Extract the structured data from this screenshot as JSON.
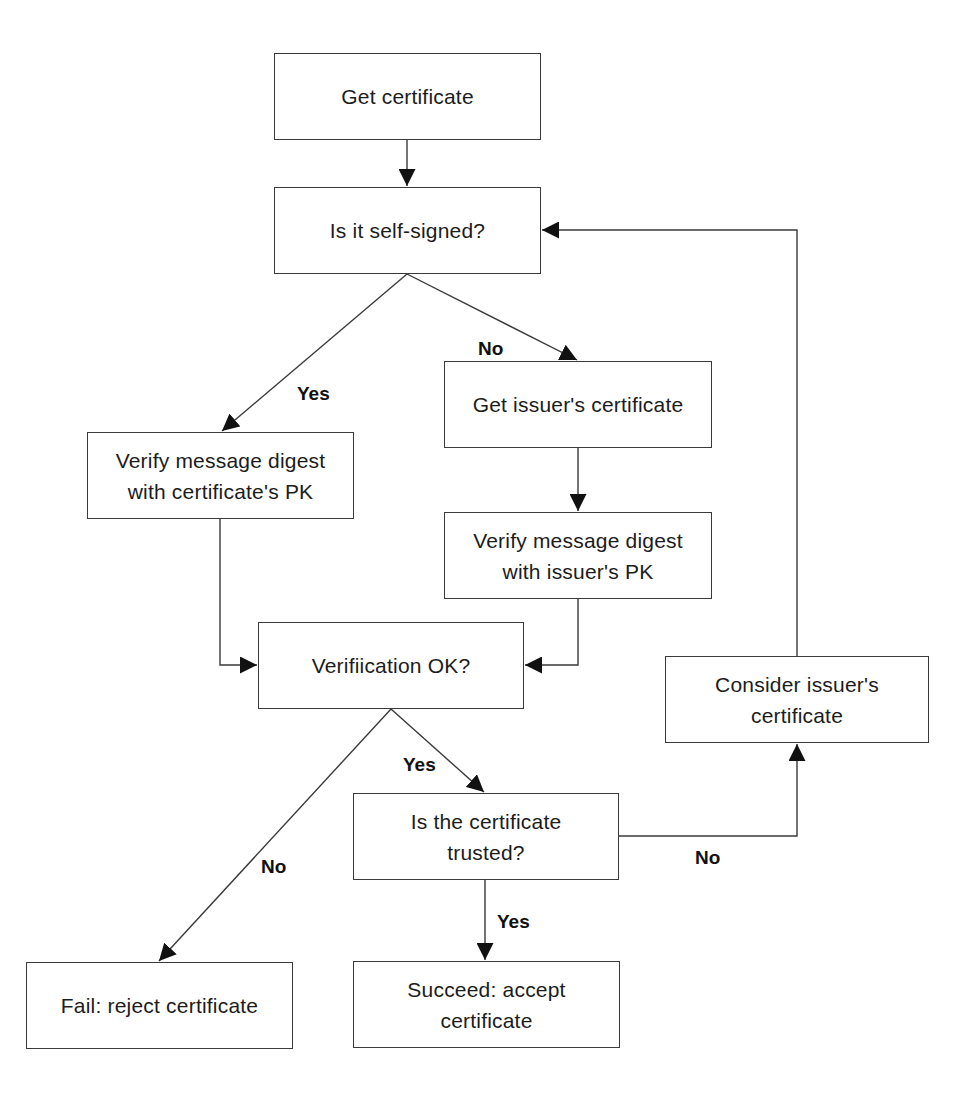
{
  "diagram": {
    "type": "flowchart",
    "nodes": [
      {
        "id": "get-cert",
        "text": "Get certificate",
        "x": 274,
        "y": 53,
        "w": 267,
        "h": 87
      },
      {
        "id": "self-signed",
        "text": "Is it self-signed?",
        "x": 274,
        "y": 187,
        "w": 267,
        "h": 87
      },
      {
        "id": "verify-cert-pk",
        "text": "Verify message digest\nwith certificate's PK",
        "x": 87,
        "y": 432,
        "w": 267,
        "h": 87
      },
      {
        "id": "get-issuer-cert",
        "text": "Get issuer's certificate",
        "x": 444,
        "y": 361,
        "w": 268,
        "h": 87
      },
      {
        "id": "verify-issuer-pk",
        "text": "Verify message digest\nwith issuer's PK",
        "x": 444,
        "y": 512,
        "w": 268,
        "h": 87
      },
      {
        "id": "verification-ok",
        "text": "Verifiication OK?",
        "x": 258,
        "y": 622,
        "w": 266,
        "h": 87
      },
      {
        "id": "consider-issuer",
        "text": "Consider issuer's\ncertificate",
        "x": 665,
        "y": 656,
        "w": 264,
        "h": 87
      },
      {
        "id": "trusted",
        "text": "Is the certificate\ntrusted?",
        "x": 353,
        "y": 793,
        "w": 266,
        "h": 87
      },
      {
        "id": "fail",
        "text": "Fail: reject certificate",
        "x": 26,
        "y": 962,
        "w": 267,
        "h": 87
      },
      {
        "id": "succeed",
        "text": "Succeed: accept\ncertificate",
        "x": 353,
        "y": 961,
        "w": 267,
        "h": 87
      }
    ],
    "edge_labels": [
      {
        "id": "self-signed-yes",
        "text": "Yes",
        "x": 297,
        "y": 384
      },
      {
        "id": "self-signed-no",
        "text": "No",
        "x": 478,
        "y": 339
      },
      {
        "id": "verification-yes",
        "text": "Yes",
        "x": 403,
        "y": 755
      },
      {
        "id": "verification-no",
        "text": "No",
        "x": 261,
        "y": 857
      },
      {
        "id": "trusted-no",
        "text": "No",
        "x": 695,
        "y": 848
      },
      {
        "id": "trusted-yes",
        "text": "Yes",
        "x": 497,
        "y": 912
      }
    ],
    "edges": [
      {
        "from": "get-cert",
        "to": "self-signed",
        "label": ""
      },
      {
        "from": "self-signed",
        "to": "verify-cert-pk",
        "label": "Yes"
      },
      {
        "from": "self-signed",
        "to": "get-issuer-cert",
        "label": "No"
      },
      {
        "from": "get-issuer-cert",
        "to": "verify-issuer-pk",
        "label": ""
      },
      {
        "from": "verify-cert-pk",
        "to": "verification-ok",
        "label": ""
      },
      {
        "from": "verify-issuer-pk",
        "to": "verification-ok",
        "label": ""
      },
      {
        "from": "verification-ok",
        "to": "trusted",
        "label": "Yes"
      },
      {
        "from": "verification-ok",
        "to": "fail",
        "label": "No"
      },
      {
        "from": "trusted",
        "to": "succeed",
        "label": "Yes"
      },
      {
        "from": "trusted",
        "to": "consider-issuer",
        "label": "No"
      },
      {
        "from": "consider-issuer",
        "to": "self-signed",
        "label": ""
      }
    ],
    "colors": {
      "line": "#3a3a3a",
      "text": "#1c1c1c",
      "background": "#ffffff"
    }
  }
}
